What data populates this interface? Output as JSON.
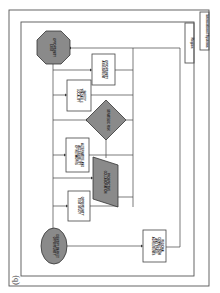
{
  "panel_label": "(b)",
  "containers": {
    "outer": {
      "label": "International Systems"
    },
    "inner": {
      "label": "Region"
    }
  },
  "nodes": {
    "start": {
      "shape": "ellipse",
      "label_1": "IDENTIFY MARKET",
      "label_2": "OPPORTUNITY"
    },
    "test_study": {
      "shape": "rectangle",
      "label_1": "OPPORTUNITY",
      "label_2": "TEST STUDY"
    },
    "collaboration": {
      "shape": "parallelogram",
      "label_1": "PROSPECTIVE",
      "label_2": "COLLABORATION"
    },
    "alternative": {
      "shape": "rectangle",
      "label_1": "ALTERNATIVE AND",
      "label_2": "ACCESSIBILITY",
      "label_3": "OF NETWORKS"
    },
    "decision": {
      "shape": "diamond",
      "label_1": "STRATEGIC RISK"
    },
    "safety": {
      "shape": "rectangle",
      "label_1": "SAFETY",
      "label_2": "TRADABLE",
      "label_3": "LOCALITY"
    },
    "assessment": {
      "shape": "rectangle",
      "label_1": "OPPORTUNITY",
      "label_2": "ASSESSMENT"
    },
    "end": {
      "shape": "octagon",
      "label_1": "OPPORTUNITY",
      "label_2": "EXIST"
    },
    "regional": {
      "shape": "rectangle",
      "label_1": "REGIONAL",
      "label_2": "CONNECTION",
      "label_3": "AND TRADE",
      "label_4": "AGREEMENTS"
    }
  },
  "colors": {
    "shape_fill_gray": "#8a8a8a",
    "stroke": "#444444",
    "background": "#ffffff"
  }
}
